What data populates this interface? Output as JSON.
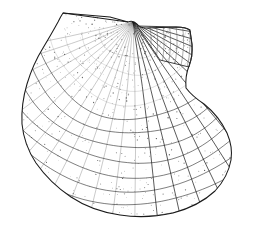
{
  "figure": {
    "style": "stippled pen-and-ink scientific illustration",
    "background_color": "#ffffff",
    "ink_color": "#1a1a1a",
    "stipple_color": "#3a3a3a",
    "light_line_color": "#6b6b6b",
    "canvas": {
      "width": 254,
      "height": 231
    }
  },
  "shell": {
    "outline_path": "M 63 13 L 110 17 L 128 22 Q 133 20 137 24 Q 140 28 146 28 L 176 27 Q 186 27 190 30 L 192 44 Q 193 56 189 66 Q 185 76 186 88 Q 192 96 204 104 Q 219 116 227 133 Q 233 147 231 160 Q 228 177 215 191 Q 199 206 173 213 Q 146 219 120 215 Q 92 211 71 197 Q 50 183 36 163 Q 24 145 22 124 Q 21 104 27 84 Q 33 64 43 48 Q 52 33 58 22 Q 61 16 63 13 Z",
    "hinge_line": "M 63 13 L 128 22",
    "umbo": {
      "x": 133,
      "y": 22,
      "label": "umbo-apex"
    },
    "right_auricle_path": "M 137 26 L 176 27 Q 187 27 190 31 L 192 45 Q 193 57 189 67 L 160 60 Z",
    "right_notch": {
      "x": 186,
      "y": 88
    },
    "rib_count": 24,
    "growth_line_count": 13,
    "rib_fan": {
      "start_angle_deg": 191,
      "end_angle_deg": 349
    },
    "stipple_dot_count": 4200
  },
  "labels": {
    "figure_caption": ""
  }
}
